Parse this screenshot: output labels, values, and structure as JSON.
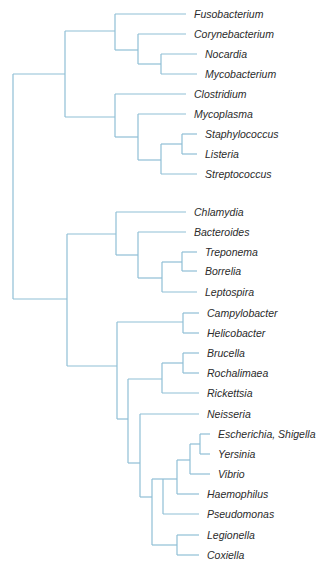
{
  "diagram": {
    "type": "phylogenetic-tree",
    "line_color": "#8fbfd6",
    "text_color": "#2b2b2b",
    "taxa": [
      {
        "label": "Fusobacterium",
        "y": 14,
        "x_line_start": 115,
        "x_line_end": 186,
        "x_text": 194
      },
      {
        "label": "Corynebacterium",
        "y": 34,
        "x_line_start": 138,
        "x_line_end": 186,
        "x_text": 194
      },
      {
        "label": "Nocardia",
        "y": 54,
        "x_line_start": 161,
        "x_line_end": 197,
        "x_text": 205
      },
      {
        "label": "Mycobacterium",
        "y": 74,
        "x_line_start": 161,
        "x_line_end": 197,
        "x_text": 205
      },
      {
        "label": "Clostridium",
        "y": 94,
        "x_line_start": 115,
        "x_line_end": 186,
        "x_text": 194
      },
      {
        "label": "Mycoplasma",
        "y": 114,
        "x_line_start": 138,
        "x_line_end": 186,
        "x_text": 194
      },
      {
        "label": "Staphylococcus",
        "y": 134,
        "x_line_start": 182,
        "x_line_end": 197,
        "x_text": 205
      },
      {
        "label": "Listeria",
        "y": 154,
        "x_line_start": 182,
        "x_line_end": 197,
        "x_text": 205
      },
      {
        "label": "Streptococcus",
        "y": 174,
        "x_line_start": 161,
        "x_line_end": 197,
        "x_text": 205
      },
      {
        "label": "Chlamydia",
        "y": 212,
        "x_line_start": 116,
        "x_line_end": 186,
        "x_text": 194
      },
      {
        "label": "Bacteroides",
        "y": 232,
        "x_line_start": 138,
        "x_line_end": 186,
        "x_text": 194
      },
      {
        "label": "Treponema",
        "y": 252,
        "x_line_start": 182,
        "x_line_end": 197,
        "x_text": 205
      },
      {
        "label": "Borrelia",
        "y": 271,
        "x_line_start": 182,
        "x_line_end": 197,
        "x_text": 205
      },
      {
        "label": "Leptospira",
        "y": 292,
        "x_line_start": 162,
        "x_line_end": 197,
        "x_text": 205
      },
      {
        "label": "Campylobacter",
        "y": 313,
        "x_line_start": 183,
        "x_line_end": 199,
        "x_text": 207
      },
      {
        "label": "Helicobacter",
        "y": 333,
        "x_line_start": 183,
        "x_line_end": 199,
        "x_text": 207
      },
      {
        "label": "Brucella",
        "y": 353,
        "x_line_start": 183,
        "x_line_end": 199,
        "x_text": 207
      },
      {
        "label": "Rochalimaea",
        "y": 373,
        "x_line_start": 183,
        "x_line_end": 199,
        "x_text": 207
      },
      {
        "label": "Rickettsia",
        "y": 393,
        "x_line_start": 162,
        "x_line_end": 199,
        "x_text": 207
      },
      {
        "label": "Neisseria",
        "y": 414,
        "x_line_start": 140,
        "x_line_end": 199,
        "x_text": 207
      },
      {
        "label": "Escherichia, Shigella",
        "y": 434,
        "x_line_start": 200,
        "x_line_end": 210,
        "x_text": 218
      },
      {
        "label": "Yersinia",
        "y": 454,
        "x_line_start": 200,
        "x_line_end": 210,
        "x_text": 218
      },
      {
        "label": "Vibrio",
        "y": 474,
        "x_line_start": 190,
        "x_line_end": 210,
        "x_text": 218
      },
      {
        "label": "Haemophilus",
        "y": 494,
        "x_line_start": 177,
        "x_line_end": 199,
        "x_text": 207
      },
      {
        "label": "Pseudomonas",
        "y": 514,
        "x_line_start": 163,
        "x_line_end": 199,
        "x_text": 207
      },
      {
        "label": "Legionella",
        "y": 535,
        "x_line_start": 177,
        "x_line_end": 199,
        "x_text": 207
      },
      {
        "label": "Coxiella",
        "y": 555,
        "x_line_start": 177,
        "x_line_end": 199,
        "x_text": 207
      }
    ],
    "nodes": [
      {
        "x": 13,
        "y1": 74,
        "y2": 299,
        "parent_x": null
      },
      {
        "x": 65,
        "y1": 31,
        "y2": 117,
        "parent_x": 13,
        "join_y": 74
      },
      {
        "x": 115,
        "y1": 14,
        "y2": 50,
        "parent_x": 65,
        "join_y": 31
      },
      {
        "x": 138,
        "y1": 34,
        "y2": 64,
        "parent_x": 115,
        "join_y": 50
      },
      {
        "x": 161,
        "y1": 54,
        "y2": 74,
        "parent_x": 138,
        "join_y": 64
      },
      {
        "x": 115,
        "y1": 94,
        "y2": 137,
        "parent_x": 65,
        "join_y": 117
      },
      {
        "x": 138,
        "y1": 114,
        "y2": 160,
        "parent_x": 115,
        "join_y": 137
      },
      {
        "x": 161,
        "y1": 144,
        "y2": 174,
        "parent_x": 138,
        "join_y": 160
      },
      {
        "x": 182,
        "y1": 134,
        "y2": 154,
        "parent_x": 161,
        "join_y": 144
      },
      {
        "x": 67,
        "y1": 234,
        "y2": 366,
        "parent_x": 13,
        "join_y": 299
      },
      {
        "x": 116,
        "y1": 212,
        "y2": 255,
        "parent_x": 67,
        "join_y": 234
      },
      {
        "x": 138,
        "y1": 232,
        "y2": 278,
        "parent_x": 116,
        "join_y": 255
      },
      {
        "x": 162,
        "y1": 262,
        "y2": 292,
        "parent_x": 138,
        "join_y": 278
      },
      {
        "x": 182,
        "y1": 252,
        "y2": 271,
        "parent_x": 162,
        "join_y": 262
      },
      {
        "x": 117,
        "y1": 322,
        "y2": 419,
        "parent_x": 67,
        "join_y": 366
      },
      {
        "x": 183,
        "y1": 313,
        "y2": 333,
        "parent_x": 117,
        "join_y": 322
      },
      {
        "x": 128,
        "y1": 379,
        "y2": 463,
        "parent_x": 117,
        "join_y": 419
      },
      {
        "x": 162,
        "y1": 363,
        "y2": 393,
        "parent_x": 128,
        "join_y": 379
      },
      {
        "x": 183,
        "y1": 353,
        "y2": 373,
        "parent_x": 162,
        "join_y": 363
      },
      {
        "x": 140,
        "y1": 414,
        "y2": 497,
        "parent_x": 128,
        "join_y": 463
      },
      {
        "x": 152,
        "y1": 479,
        "y2": 545,
        "parent_x": 140,
        "join_y": 497
      },
      {
        "x": 163,
        "y1": 479,
        "y2": 514,
        "parent_x": 152,
        "join_y": 479
      },
      {
        "x": 177,
        "y1": 460,
        "y2": 494,
        "parent_x": 163,
        "join_y": 479
      },
      {
        "x": 190,
        "y1": 444,
        "y2": 474,
        "parent_x": 177,
        "join_y": 460
      },
      {
        "x": 200,
        "y1": 434,
        "y2": 454,
        "parent_x": 190,
        "join_y": 444
      },
      {
        "x": 177,
        "y1": 535,
        "y2": 555,
        "parent_x": 152,
        "join_y": 545
      }
    ]
  }
}
